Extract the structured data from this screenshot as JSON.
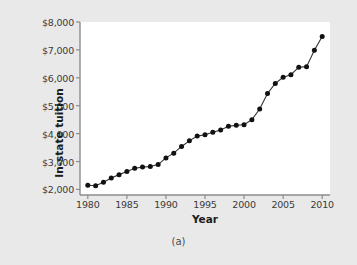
{
  "figure": {
    "caption": "(a)",
    "background_color": "#e9e9e9",
    "panel_color": "#ffffff"
  },
  "chart_data": {
    "type": "line",
    "title": "",
    "xlabel": "Year",
    "ylabel": "In-state tuition",
    "xlim": [
      1979,
      2011
    ],
    "ylim": [
      1800,
      8000
    ],
    "xticks": [
      1980,
      1985,
      1990,
      1995,
      2000,
      2005,
      2010
    ],
    "xtick_labels": [
      "1980",
      "1985",
      "1990",
      "1995",
      "2000",
      "2005",
      "2010"
    ],
    "yticks": [
      2000,
      3000,
      4000,
      5000,
      6000,
      7000,
      8000
    ],
    "ytick_labels": [
      "$2,000",
      "$3,000",
      "$4,000",
      "$5,000",
      "$6,000",
      "$7,000",
      "$8,000"
    ],
    "grid": false,
    "legend": null,
    "marker": "filled-circle",
    "marker_color": "#111111",
    "line_color": "#333333",
    "x": [
      1980,
      1981,
      1982,
      1983,
      1984,
      1985,
      1986,
      1987,
      1988,
      1989,
      1990,
      1991,
      1992,
      1993,
      1994,
      1995,
      1996,
      1997,
      1998,
      1999,
      2000,
      2001,
      2002,
      2003,
      2004,
      2005,
      2006,
      2007,
      2008,
      2009,
      2010
    ],
    "values": [
      2150,
      2130,
      2260,
      2410,
      2530,
      2640,
      2760,
      2800,
      2820,
      2890,
      3130,
      3300,
      3540,
      3740,
      3910,
      3960,
      4050,
      4130,
      4260,
      4300,
      4320,
      4500,
      4880,
      5440,
      5800,
      6020,
      6110,
      6380,
      6400,
      6990,
      7480
    ],
    "series_name": "In-state tuition"
  }
}
